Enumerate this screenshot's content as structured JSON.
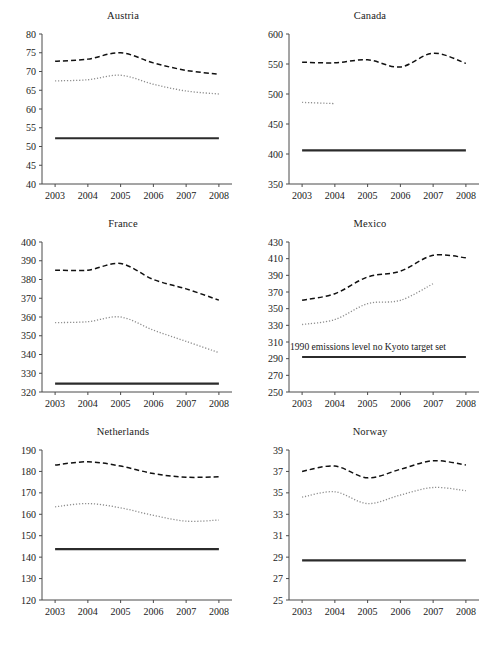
{
  "figure": {
    "top_cropped_text": "",
    "bottom_cropped_text": "",
    "layout": {
      "rows": 3,
      "cols": 2
    },
    "x_categories": [
      "2003",
      "2004",
      "2005",
      "2006",
      "2007",
      "2008"
    ],
    "series_styles": {
      "dashed": "long-dashed black line",
      "dotted": "fine dotted grey line",
      "solid": "thick solid black horizontal line"
    }
  },
  "chart_data": [
    {
      "type": "line",
      "title": "Austria",
      "xlabel": "",
      "ylabel": "",
      "x": [
        2003,
        2004,
        2005,
        2006,
        2007,
        2008
      ],
      "xlim": [
        2002.6,
        2008.4
      ],
      "ylim": [
        40,
        80
      ],
      "yticks": [
        40,
        45,
        50,
        55,
        60,
        65,
        70,
        75,
        80
      ],
      "grid": false,
      "legend": "none",
      "series": [
        {
          "name": "dashed",
          "style": "dashed",
          "values": [
            72.7,
            73.3,
            75.0,
            72.3,
            70.3,
            69.3
          ]
        },
        {
          "name": "dotted",
          "style": "dotted",
          "values": [
            67.5,
            67.8,
            69.0,
            66.6,
            64.8,
            64.0
          ]
        },
        {
          "name": "solid",
          "style": "solid",
          "values": [
            52.2,
            52.2,
            52.2,
            52.2,
            52.2,
            52.2
          ]
        }
      ]
    },
    {
      "type": "line",
      "title": "Canada",
      "xlabel": "",
      "ylabel": "",
      "x": [
        2003,
        2004,
        2005,
        2006,
        2007,
        2008
      ],
      "xlim": [
        2002.6,
        2008.4
      ],
      "ylim": [
        350,
        600
      ],
      "yticks": [
        350,
        400,
        450,
        500,
        550,
        600
      ],
      "grid": false,
      "legend": "none",
      "series": [
        {
          "name": "dashed",
          "style": "dashed",
          "values": [
            553,
            552,
            557,
            545,
            568,
            551
          ]
        },
        {
          "name": "dotted",
          "style": "dotted",
          "values": [
            486,
            484,
            null,
            null,
            null,
            null
          ]
        },
        {
          "name": "solid",
          "style": "solid",
          "values": [
            406,
            406,
            406,
            406,
            406,
            406
          ]
        }
      ]
    },
    {
      "type": "line",
      "title": "France",
      "xlabel": "",
      "ylabel": "",
      "x": [
        2003,
        2004,
        2005,
        2006,
        2007,
        2008
      ],
      "xlim": [
        2002.6,
        2008.4
      ],
      "ylim": [
        320,
        400
      ],
      "yticks": [
        320,
        330,
        340,
        350,
        360,
        370,
        380,
        390,
        400
      ],
      "grid": false,
      "legend": "none",
      "series": [
        {
          "name": "dashed",
          "style": "dashed",
          "values": [
            385,
            385,
            388.5,
            380,
            375,
            369
          ]
        },
        {
          "name": "dotted",
          "style": "dotted",
          "values": [
            357,
            357.5,
            360,
            353,
            347,
            341
          ]
        },
        {
          "name": "solid",
          "style": "solid",
          "values": [
            324.5,
            324.5,
            324.5,
            324.5,
            324.5,
            324.5
          ]
        }
      ]
    },
    {
      "type": "line",
      "title": "Mexico",
      "xlabel": "",
      "ylabel": "",
      "x": [
        2003,
        2004,
        2005,
        2006,
        2007,
        2008
      ],
      "xlim": [
        2002.6,
        2008.4
      ],
      "ylim": [
        250,
        430
      ],
      "yticks": [
        250,
        270,
        290,
        310,
        330,
        350,
        370,
        390,
        410,
        430
      ],
      "grid": false,
      "legend": "none",
      "annotation": "1990 emissions level no Kyoto target set",
      "annotation_value": 300,
      "series": [
        {
          "name": "dashed",
          "style": "dashed",
          "values": [
            360,
            368,
            388,
            395,
            414,
            411
          ]
        },
        {
          "name": "dotted",
          "style": "dotted",
          "values": [
            331,
            337,
            356,
            360,
            380,
            null
          ]
        },
        {
          "name": "solid",
          "style": "solid",
          "values": [
            292,
            292,
            292,
            292,
            292,
            292
          ]
        }
      ]
    },
    {
      "type": "line",
      "title": "Netherlands",
      "xlabel": "",
      "ylabel": "",
      "x": [
        2003,
        2004,
        2005,
        2006,
        2007,
        2008
      ],
      "xlim": [
        2002.6,
        2008.4
      ],
      "ylim": [
        120,
        190
      ],
      "yticks": [
        120,
        130,
        140,
        150,
        160,
        170,
        180,
        190
      ],
      "grid": false,
      "legend": "none",
      "series": [
        {
          "name": "dashed",
          "style": "dashed",
          "values": [
            183.0,
            184.5,
            182.5,
            179.0,
            177.3,
            177.5
          ]
        },
        {
          "name": "dotted",
          "style": "dotted",
          "values": [
            163.5,
            165.0,
            163.0,
            159.5,
            156.8,
            157.3
          ]
        },
        {
          "name": "solid",
          "style": "solid",
          "values": [
            143.7,
            143.7,
            143.7,
            143.7,
            143.7,
            143.7
          ]
        }
      ]
    },
    {
      "type": "line",
      "title": "Norway",
      "xlabel": "",
      "ylabel": "",
      "x": [
        2003,
        2004,
        2005,
        2006,
        2007,
        2008
      ],
      "xlim": [
        2002.6,
        2008.4
      ],
      "ylim": [
        25,
        39
      ],
      "yticks": [
        25,
        27,
        29,
        31,
        33,
        35,
        37,
        39
      ],
      "grid": false,
      "legend": "none",
      "series": [
        {
          "name": "dashed",
          "style": "dashed",
          "values": [
            37.0,
            37.5,
            36.4,
            37.2,
            38.0,
            37.6
          ]
        },
        {
          "name": "dotted",
          "style": "dotted",
          "values": [
            34.6,
            35.1,
            34.0,
            34.8,
            35.5,
            35.2
          ]
        },
        {
          "name": "solid",
          "style": "solid",
          "values": [
            28.7,
            28.7,
            28.7,
            28.7,
            28.7,
            28.7
          ]
        }
      ]
    }
  ],
  "colors": {
    "dashed": "#111111",
    "dotted": "#8d8d8d",
    "solid": "#2b2b2b",
    "axis": "#4a4a4a",
    "text": "#1a1a1a",
    "background": "#ffffff"
  }
}
